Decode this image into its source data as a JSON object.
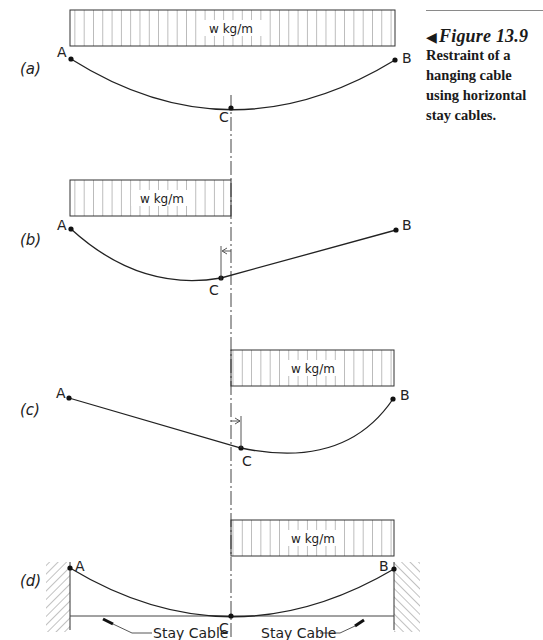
{
  "caption": {
    "figure_label": "Figure 13.9",
    "marker": "◀",
    "text": "Restraint of a hanging cable using horizontal stay cables."
  },
  "panels": [
    {
      "id": "a",
      "label": "(a)",
      "load": "w kg/m",
      "points": {
        "A": "A",
        "B": "B",
        "C": "C"
      }
    },
    {
      "id": "b",
      "label": "(b)",
      "load": "w kg/m",
      "points": {
        "A": "A",
        "B": "B",
        "C": "C"
      }
    },
    {
      "id": "c",
      "label": "(c)",
      "load": "w kg/m",
      "points": {
        "A": "A",
        "B": "B",
        "C": "C"
      }
    },
    {
      "id": "d",
      "label": "(d)",
      "load": "w kg/m",
      "points": {
        "A": "A",
        "B": "B",
        "C": "C"
      },
      "stay_cable_left": "Stay Cable",
      "stay_cable_right": "Stay Cable"
    }
  ],
  "colors": {
    "line": "#222222",
    "hatch": "#555555",
    "rule": "#8a8a8a"
  }
}
